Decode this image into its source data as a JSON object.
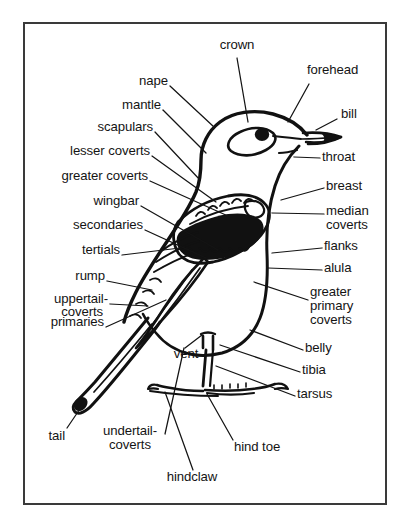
{
  "diagram": {
    "frame_color": "#3a3a3a",
    "ink_color": "#111111",
    "background_color": "#ffffff",
    "label_count": 28
  },
  "labels": {
    "crown": "crown",
    "forehead": "forehead",
    "nape": "nape",
    "bill": "bill",
    "mantle": "mantle",
    "scapulars": "scapulars",
    "throat": "throat",
    "lesser_coverts": "lesser coverts",
    "breast": "breast",
    "greater_coverts": "greater coverts",
    "median_coverts_line1": "median",
    "median_coverts_line2": "coverts",
    "wingbar": "wingbar",
    "secondaries": "secondaries",
    "flanks": "flanks",
    "tertials": "tertials",
    "alula": "alula",
    "rump": "rump",
    "greater_primary_coverts_line1": "greater",
    "greater_primary_coverts_line2": "primary",
    "greater_primary_coverts_line3": "coverts",
    "uppertail_coverts_line1": "uppertail-",
    "uppertail_coverts_line2": "coverts",
    "primaries": "primaries",
    "belly": "belly",
    "vent": "vent",
    "tibia": "tibia",
    "tarsus": "tarsus",
    "tail": "tail",
    "undertail_coverts_line1": "undertail-",
    "undertail_coverts_line2": "coverts",
    "hind_toe": "hind toe",
    "hindclaw": "hindclaw"
  }
}
